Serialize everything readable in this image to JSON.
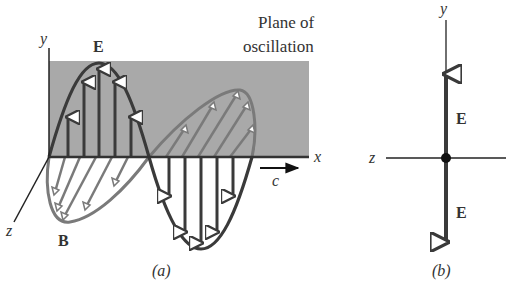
{
  "panel_a": {
    "caption": "(a)",
    "plane_label_line1": "Plane of",
    "plane_label_line2": "oscillation",
    "axis_y": "y",
    "axis_x": "x",
    "axis_z": "z",
    "e_field_label": "E",
    "b_field_label": "B",
    "speed_label": "c"
  },
  "panel_b": {
    "caption": "(b)",
    "axis_y": "y",
    "axis_z": "z",
    "e_field_up_label": "E",
    "e_field_down_label": "E"
  },
  "colors": {
    "plane_fill": "#a9a9a9",
    "e_wave": "#3a3a3a",
    "b_wave": "#7a7a7a",
    "axis": "#222222"
  }
}
